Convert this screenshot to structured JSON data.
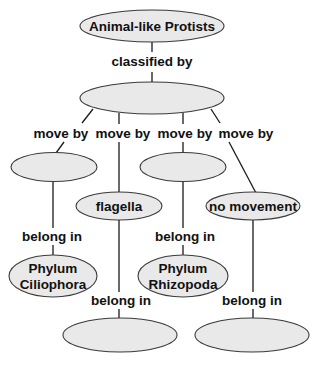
{
  "diagram": {
    "colors": {
      "node_fill": "#e9e9e9",
      "node_stroke": "#3a3a3a",
      "line": "#1a1a1a",
      "text": "#111111"
    },
    "nodes": {
      "root": {
        "label": "Animal-like Protists"
      },
      "classifier": {
        "label": ""
      },
      "move1": {
        "label": ""
      },
      "move2": {
        "label": "flagella"
      },
      "move3": {
        "label": ""
      },
      "move4": {
        "label": "no movement"
      },
      "phylum1": {
        "line1": "Phylum",
        "line2": "Ciliophora"
      },
      "phylum2": {
        "label": ""
      },
      "phylum3": {
        "line1": "Phylum",
        "line2": "Rhizopoda"
      },
      "phylum4": {
        "label": ""
      }
    },
    "links": {
      "classified_by": "classified by",
      "move_by": [
        "move by",
        "move by",
        "move by",
        "move by"
      ],
      "belong_in": [
        "belong in",
        "belong in",
        "belong in",
        "belong in"
      ]
    }
  }
}
